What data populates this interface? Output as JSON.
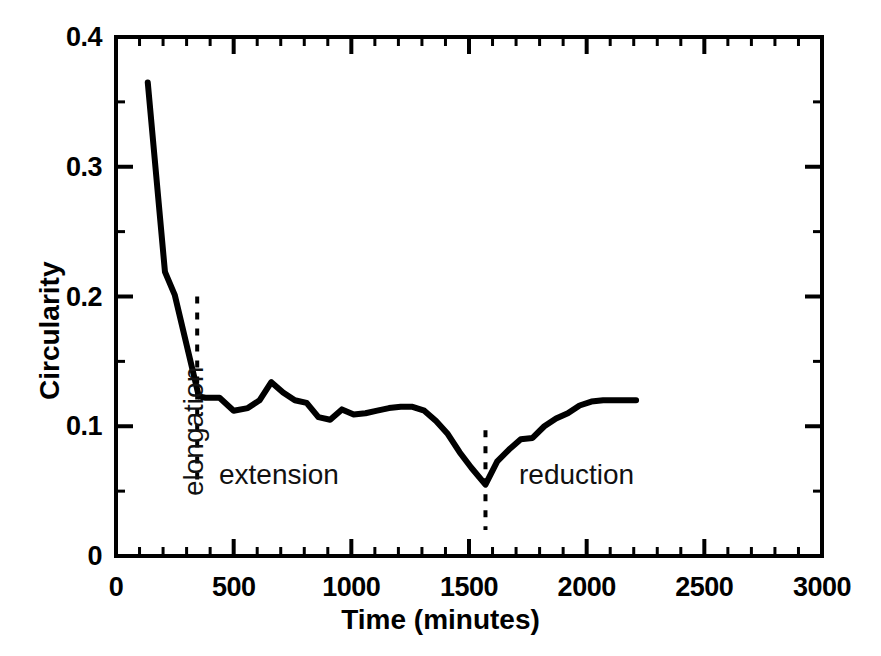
{
  "chart_data": {
    "type": "line",
    "title": "",
    "xlabel": "Time (minutes)",
    "ylabel": "Circularity",
    "xlim": [
      0,
      3000
    ],
    "ylim": [
      0,
      0.4
    ],
    "x_major_ticks": [
      0,
      500,
      1000,
      1500,
      2000,
      2500,
      3000
    ],
    "x_tick_labels": [
      "0",
      "500",
      "1000",
      "1500",
      "2000",
      "2500",
      "3000"
    ],
    "x_minor_tick_step": 100,
    "y_major_ticks": [
      0,
      0.1,
      0.2,
      0.3,
      0.4
    ],
    "y_tick_labels": [
      "0",
      "0.1",
      "0.2",
      "0.3",
      "0.4"
    ],
    "y_minor_tick_step": 0.05,
    "grid": false,
    "legend": false,
    "series": [
      {
        "name": "Circularity",
        "color": "#000000",
        "x": [
          135,
          208,
          250,
          352,
          380,
          440,
          500,
          560,
          610,
          660,
          710,
          760,
          810,
          860,
          910,
          960,
          1010,
          1060,
          1110,
          1160,
          1210,
          1260,
          1310,
          1360,
          1410,
          1460,
          1510,
          1570,
          1620,
          1670,
          1720,
          1770,
          1820,
          1870,
          1920,
          1970,
          2020,
          2070,
          2120,
          2210
        ],
        "y": [
          0.365,
          0.219,
          0.201,
          0.123,
          0.122,
          0.122,
          0.112,
          0.114,
          0.12,
          0.134,
          0.126,
          0.12,
          0.118,
          0.107,
          0.105,
          0.113,
          0.109,
          0.11,
          0.112,
          0.114,
          0.115,
          0.115,
          0.112,
          0.104,
          0.094,
          0.08,
          0.068,
          0.055,
          0.073,
          0.082,
          0.09,
          0.091,
          0.1,
          0.106,
          0.11,
          0.116,
          0.119,
          0.12,
          0.12,
          0.12
        ]
      }
    ],
    "annotations": [
      {
        "text": "elongation",
        "orientation": "vertical",
        "region_start": 0,
        "region_end": 345
      },
      {
        "text": "extension",
        "orientation": "horizontal",
        "region_start": 345,
        "region_end": 1570
      },
      {
        "text": "reduction",
        "orientation": "horizontal",
        "region_start": 1570,
        "region_end": 3000
      }
    ],
    "dividers": [
      {
        "x": 345,
        "style": "dashed",
        "y_from": 0.058,
        "y_to": 0.2
      },
      {
        "x": 1570,
        "style": "dashed",
        "y_from": 0.02,
        "y_to": 0.097
      }
    ]
  },
  "axes": {
    "frame_color": "#000000",
    "line_color": "#000000"
  }
}
